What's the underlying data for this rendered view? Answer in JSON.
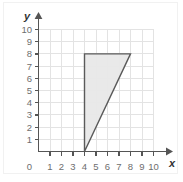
{
  "figure": {
    "name": "coordinate-plane-with-shaded-triangle",
    "background_color": "#ffffff",
    "grid_color": "#e3e3e3",
    "axis_color": "#555555",
    "label_color": "#6e6e6e"
  },
  "axes": {
    "x": {
      "label": "x",
      "min": 0,
      "max": 10,
      "tick_labels": [
        "1",
        "2",
        "3",
        "4",
        "5",
        "6",
        "7",
        "8",
        "9",
        "10"
      ],
      "origin_label": "0",
      "arrow": true
    },
    "y": {
      "label": "y",
      "min": 0,
      "max": 10,
      "tick_labels": [
        "1",
        "2",
        "3",
        "4",
        "5",
        "6",
        "7",
        "8",
        "9",
        "10"
      ],
      "arrow": true
    }
  },
  "chart_data": {
    "type": "scatter",
    "title": "",
    "xlabel": "x",
    "ylabel": "y",
    "xlim": [
      0,
      10
    ],
    "ylim": [
      0,
      10
    ],
    "grid": true,
    "legend": null,
    "x_ticks": [
      0,
      1,
      2,
      3,
      4,
      5,
      6,
      7,
      8,
      9,
      10
    ],
    "y_ticks": [
      0,
      1,
      2,
      3,
      4,
      5,
      6,
      7,
      8,
      9,
      10
    ],
    "shapes": [
      {
        "name": "triangle",
        "type": "polygon",
        "vertices": [
          [
            4,
            0
          ],
          [
            4,
            8
          ],
          [
            8,
            8
          ]
        ],
        "fill": "#e8e8e8",
        "stroke": "#5a5a5a",
        "stroke_width": 1
      }
    ]
  }
}
